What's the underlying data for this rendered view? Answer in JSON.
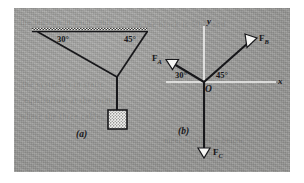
{
  "figure": {
    "background_color": "#9d9d9b",
    "ink_color": "#17171a",
    "axis_color": "#f2f2f0",
    "parts": [
      {
        "key": "a",
        "label": "(a)"
      },
      {
        "key": "b",
        "label": "(b)"
      }
    ],
    "ghost_text": [
      "the tension in each cable",
      "of the block is 50 N and",
      "the system is in static",
      "equilibrium at the joint",
      "where the three cables",
      "meet as shown below"
    ]
  },
  "diagram_a": {
    "name": "suspended-block-cable-system",
    "caption": "(a)",
    "ceiling": {
      "label": "hatched-ceiling-support"
    },
    "angles": [
      {
        "id": "left-cable-angle",
        "text": "30°",
        "value": 30,
        "unit": "degree"
      },
      {
        "id": "right-cable-angle",
        "text": "45°",
        "value": 45,
        "unit": "degree"
      }
    ],
    "cables": [
      {
        "id": "cable-a",
        "from": "ceiling-left-anchor",
        "to": "knot"
      },
      {
        "id": "cable-b",
        "from": "ceiling-right-anchor",
        "to": "knot"
      },
      {
        "id": "cable-c",
        "from": "knot",
        "to": "block"
      }
    ],
    "block": {
      "id": "hanging-block",
      "fill": "stippled"
    }
  },
  "diagram_b": {
    "name": "free-body-diagram",
    "caption": "(b)",
    "origin_label": "O",
    "axes": [
      {
        "id": "y-axis",
        "label": "y",
        "direction": "vertical"
      },
      {
        "id": "x-axis",
        "label": "x",
        "direction": "horizontal"
      }
    ],
    "angles": [
      {
        "id": "fa-angle",
        "text": "30°",
        "value": 30,
        "unit": "degree",
        "measured_from": "negative-x-axis"
      },
      {
        "id": "fb-angle",
        "text": "45°",
        "value": 45,
        "unit": "degree",
        "measured_from": "positive-x-axis"
      }
    ],
    "forces": [
      {
        "id": "force-a",
        "symbol": "F",
        "subscript": "A",
        "label": "F_A",
        "direction_deg": 150,
        "description": "up-and-left along cable A"
      },
      {
        "id": "force-b",
        "symbol": "F",
        "subscript": "B",
        "label": "F_B",
        "direction_deg": 45,
        "description": "up-and-right along cable B"
      },
      {
        "id": "force-c",
        "symbol": "F",
        "subscript": "C",
        "label": "F_C",
        "direction_deg": 270,
        "description": "straight down, weight of block"
      }
    ]
  }
}
